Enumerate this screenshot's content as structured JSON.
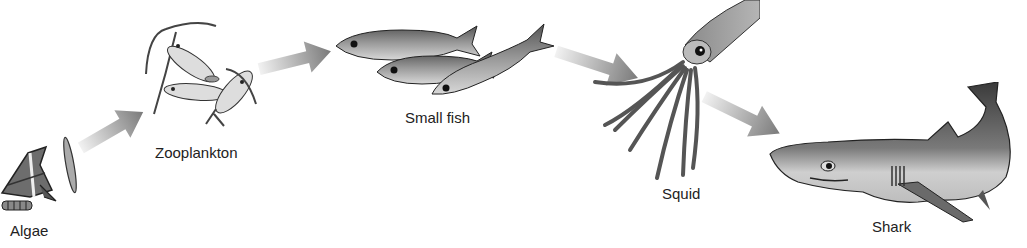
{
  "diagram": {
    "type": "food-chain",
    "organisms": [
      {
        "id": "algae",
        "label": "Algae"
      },
      {
        "id": "zooplankton",
        "label": "Zooplankton"
      },
      {
        "id": "small_fish",
        "label": "Small fish"
      },
      {
        "id": "squid",
        "label": "Squid"
      },
      {
        "id": "shark",
        "label": "Shark"
      }
    ],
    "arrows": [
      {
        "from": "Algae",
        "to": "Zooplankton"
      },
      {
        "from": "Zooplankton",
        "to": "Small fish"
      },
      {
        "from": "Small fish",
        "to": "Squid"
      },
      {
        "from": "Squid",
        "to": "Shark"
      }
    ],
    "colors": {
      "arrow_dark": "#7a7a7a",
      "arrow_light": "#e6e6e6",
      "ink": "#222222"
    }
  }
}
